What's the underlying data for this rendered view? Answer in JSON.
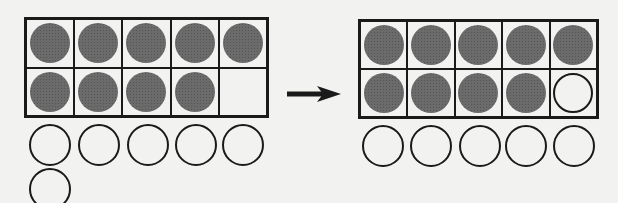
{
  "diagram": {
    "colors": {
      "filled": "#6b6b6b",
      "outline": "#1a1a1a",
      "background": "#f2f2f0"
    },
    "before": {
      "frame": [
        [
          "filled",
          "filled",
          "filled",
          "filled",
          "filled"
        ],
        [
          "filled",
          "filled",
          "filled",
          "filled",
          "empty-cell"
        ]
      ],
      "loose_counters": 6
    },
    "arrow": "right-arrow",
    "after": {
      "frame": [
        [
          "filled",
          "filled",
          "filled",
          "filled",
          "filled"
        ],
        [
          "filled",
          "filled",
          "filled",
          "filled",
          "empty"
        ]
      ],
      "loose_counters": 5
    }
  }
}
